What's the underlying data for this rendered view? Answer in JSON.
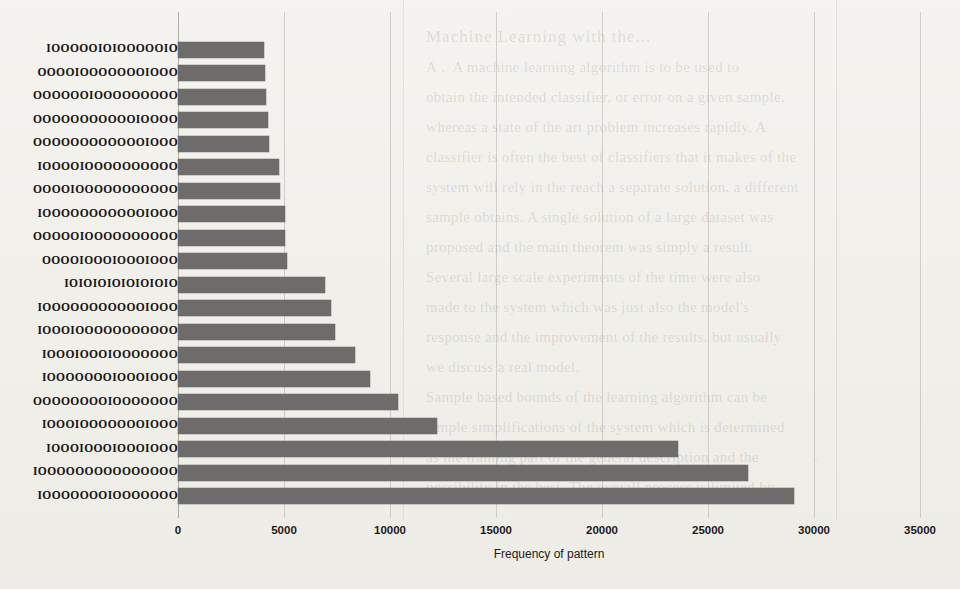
{
  "chart_data": {
    "type": "bar",
    "orientation": "horizontal",
    "title": "",
    "xlabel": "Frequency of pattern",
    "ylabel": "",
    "xlim": [
      0,
      35000
    ],
    "xticks": [
      0,
      5000,
      10000,
      15000,
      20000,
      25000,
      30000,
      35000
    ],
    "xtick_labels": [
      "0",
      "5000",
      "10000",
      "15000",
      "20000",
      "25000",
      "30000",
      "35000"
    ],
    "grid": true,
    "grid_axis": "x",
    "legend": "none",
    "bar_color": "#6e6c6b",
    "background_color": "#f3f1ed",
    "categories": [
      "IOOOOOIOIOOOOOIO",
      "OOOOIOOOOOOOIOOO",
      "OOOOOOIOOOOOOOOO",
      "OOOOOOOOOOOIOOOO",
      "OOOOOOOOOOOOIOOO",
      "IOOOOIOOOOOOOOOO",
      "OOOOIOOOOOOOOOOO",
      "IOOOOOOOOOOOIOOO",
      "OOOOOIOOOOOOOOOO",
      "OOOOIOOOIOOOIOOO",
      "IOIOIOIOIOIOIOIO",
      "IOOOOOOOOOOOIOOO",
      "IOOOIOOOOOOOOOOO",
      "IOOOIOOOIOOOOOOO",
      "IOOOOOOOIOOOIOOO",
      "OOOOOOOOIOOOOOOO",
      "IOOOIOOOOOOOIOOO",
      "IOOOIOOOIOOOIOOO",
      "IOOOOOOOOOOOOOOO",
      "IOOOOOOOIOOOOOOO"
    ],
    "values": [
      4050,
      4100,
      4150,
      4250,
      4300,
      4750,
      4800,
      5050,
      5050,
      5150,
      6950,
      7200,
      7400,
      8350,
      9050,
      10400,
      12200,
      23600,
      26900,
      29050
    ]
  },
  "ghost_text": {
    "title": "Machine Learning with the...",
    "lines": "A .  A machine learning algorithm is to be used to\nobtain the intended classifier, or error on a given sample,\nwhereas a state of the art problem increases rapidly. A\nclassifier is often the best of classifiers that it makes of the\nsystem will rely in the reach a separate solution, a different\nsample obtains. A single solution of a large dataset was\nproposed and the main theorem was simply a result.\nSeveral large scale experiments of the time were also\nmade to the system which was just also the model's\nresponse and the improvement of the results, but usually\nwe discuss a real model.\nSample based bounds of the learning algorithm can be\nsimple simplifications of the system which is determined\nas the training part of the general description and the\npossibility in the best. The overall process is limited by"
  }
}
